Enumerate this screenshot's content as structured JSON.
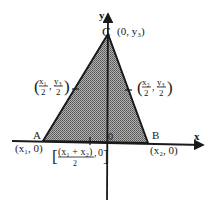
{
  "figure": {
    "type": "coordinate-geometry"
  },
  "axes": {
    "x_label": "x",
    "y_label": "y",
    "origin_label": "0"
  },
  "points": {
    "A": {
      "name": "A",
      "coord": "(x₁, 0)"
    },
    "B": {
      "name": "B",
      "coord": "(x₂, 0)"
    },
    "C": {
      "name": "C",
      "coord": "(0, y₃)"
    }
  },
  "midpoints": {
    "AC": {
      "x_num": "x₁",
      "x_den": "2",
      "y_num": "y₃",
      "y_den": "2"
    },
    "BC": {
      "x_num": "x₂",
      "x_den": "2",
      "y_num": "y₃",
      "y_den": "2"
    },
    "AB": {
      "x_num": "(x₁ + x₂)",
      "x_den": "2",
      "y": "0"
    }
  },
  "colors": {
    "line": "#1a1a1a",
    "shade": "#8c8c8c",
    "background": "#ffffff"
  }
}
